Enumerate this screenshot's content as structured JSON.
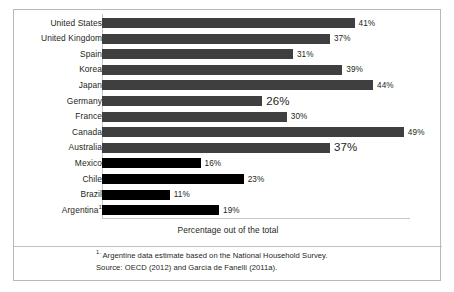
{
  "chart_data": {
    "type": "bar",
    "orientation": "horizontal",
    "title": "",
    "subtitle": "",
    "xlabel": "Percentage out of the total",
    "ylabel": "",
    "xlim": [
      0,
      50
    ],
    "grid": false,
    "legend": null,
    "categories": [
      "United States",
      "United Kingdom",
      "Spain",
      "Korea",
      "Japan",
      "Germany",
      "France",
      "Canada",
      "Australia",
      "Mexico",
      "Chile",
      "Brazil",
      "Argentina"
    ],
    "values": [
      41,
      37,
      31,
      39,
      44,
      26,
      30,
      49,
      37,
      16,
      23,
      11,
      19
    ],
    "value_labels": [
      "41%",
      "37%",
      "31%",
      "39%",
      "44%",
      "26%",
      "30%",
      "49%",
      "37%",
      "16%",
      "23%",
      "11%",
      "19%"
    ],
    "bar_colors": [
      "#3f3f3f",
      "#3f3f3f",
      "#3f3f3f",
      "#3f3f3f",
      "#3f3f3f",
      "#3f3f3f",
      "#3f3f3f",
      "#3f3f3f",
      "#3f3f3f",
      "#000000",
      "#000000",
      "#000000",
      "#000000"
    ],
    "emphasized_labels": [
      "Germany",
      "Australia"
    ],
    "footnote_markers": {
      "Argentina": "1"
    },
    "annotations": []
  },
  "footnotes": [
    {
      "marker": "1.",
      "text": " Argentine data estimate based on the National Household Survey."
    },
    {
      "marker": "",
      "text": "Source: OECD (2012) and García de Fanelli (2011a)."
    }
  ]
}
